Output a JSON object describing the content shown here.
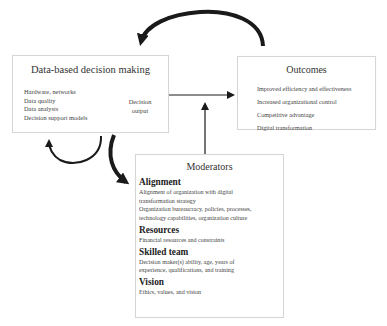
{
  "diagram": {
    "data_box": {
      "title": "Data-based decision making",
      "inputs": [
        "Hardware, networks",
        "Data quality",
        "Data analysts",
        "Decision support models"
      ],
      "output_line1": "Decision",
      "output_line2": "output"
    },
    "outcomes_box": {
      "title": "Outcomes",
      "items": [
        "Improved efficiency and effectiveness",
        "Increased organizational control",
        "Competitive advantage",
        "Digital transformation"
      ]
    },
    "moderators_box": {
      "title": "Moderators",
      "sections": [
        {
          "heading": "Alignment",
          "lines": [
            "Alignment of organization with digital",
            "transformation strategy",
            "Organization bureaucracy, policies, processes,",
            "technology capabilities, organization culture"
          ]
        },
        {
          "heading": "Resources",
          "lines": [
            "Financial resources and constraints"
          ]
        },
        {
          "heading": "Skilled team",
          "lines": [
            "Decision maker(s) ability, age, years of",
            "experience, qualifications, and training"
          ]
        },
        {
          "heading": "Vision",
          "lines": [
            "Ethics, values, and vision"
          ]
        }
      ]
    },
    "colors": {
      "arrow": "#1a1a1a",
      "border": "#d6d6d6",
      "text": "#444444"
    }
  }
}
